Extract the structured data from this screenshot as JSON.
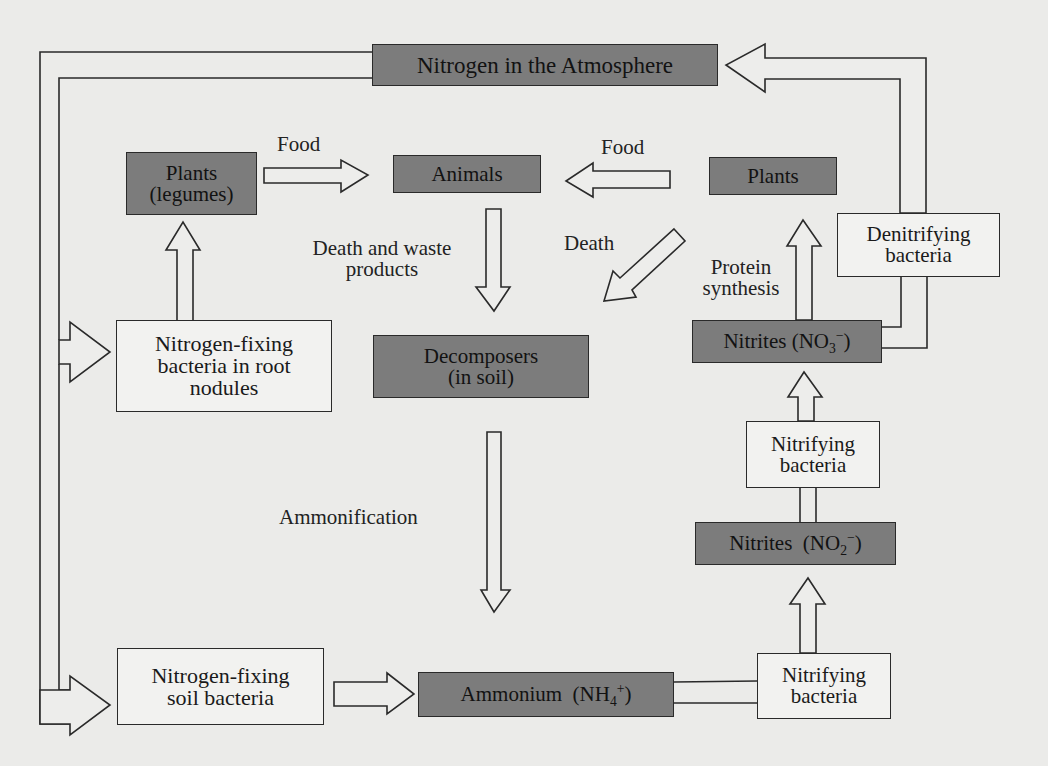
{
  "diagram": {
    "nodes": {
      "atmosphere": {
        "label": "Nitrogen in the Atmosphere",
        "style": "dark"
      },
      "plants_legumes": {
        "line1": "Plants",
        "line2": "(legumes)",
        "style": "dark"
      },
      "animals": {
        "label": "Animals",
        "style": "dark"
      },
      "plants": {
        "label": "Plants",
        "style": "dark"
      },
      "denitrifying": {
        "line1": "Denitrifying",
        "line2": "bacteria",
        "style": "light"
      },
      "root_nodules": {
        "line1": "Nitrogen-fixing",
        "line2": "bacteria in root",
        "line3": "nodules",
        "style": "light"
      },
      "decomposers": {
        "line1": "Decomposers",
        "line2": "(in soil)",
        "style": "dark"
      },
      "nitrates": {
        "prefix": "Nitrites (NO",
        "sub": "3",
        "sup": "−",
        "suffix": ")",
        "style": "dark"
      },
      "nitrifying_upper": {
        "line1": "Nitrifying",
        "line2": "bacteria",
        "style": "light"
      },
      "nitrites": {
        "prefix": "Nitrites  (NO",
        "sub": "2",
        "sup": "−",
        "suffix": ")",
        "style": "dark"
      },
      "soil_bacteria": {
        "line1": "Nitrogen-fixing",
        "line2": "soil bacteria",
        "style": "light"
      },
      "ammonium": {
        "prefix": "Ammonium  (NH",
        "sub": "4",
        "sup": "+",
        "suffix": ")",
        "style": "dark"
      },
      "nitrifying_lower": {
        "line1": "Nitrifying",
        "line2": "bacteria",
        "style": "light"
      }
    },
    "edge_labels": {
      "food_left": "Food",
      "food_right": "Food",
      "death_waste_line1": "Death and waste",
      "death_waste_line2": "products",
      "death": "Death",
      "protein_line1": "Protein",
      "protein_line2": "synthesis",
      "ammonification": "Ammonification"
    },
    "edges": [
      {
        "from": "plants_legumes",
        "to": "animals",
        "label": "Food"
      },
      {
        "from": "plants",
        "to": "animals",
        "label": "Food"
      },
      {
        "from": "animals",
        "to": "decomposers",
        "label": "Death and waste products"
      },
      {
        "from": "plants",
        "to": "decomposers",
        "label": "Death"
      },
      {
        "from": "decomposers",
        "to": "ammonium",
        "label": "Ammonification"
      },
      {
        "from": "atmosphere",
        "to": "root_nodules"
      },
      {
        "from": "atmosphere",
        "to": "soil_bacteria"
      },
      {
        "from": "root_nodules",
        "to": "plants_legumes"
      },
      {
        "from": "soil_bacteria",
        "to": "ammonium"
      },
      {
        "from": "ammonium",
        "to": "nitrifying_lower"
      },
      {
        "from": "nitrifying_lower",
        "to": "nitrites"
      },
      {
        "from": "nitrites",
        "to": "nitrifying_upper"
      },
      {
        "from": "nitrifying_upper",
        "to": "nitrates"
      },
      {
        "from": "nitrates",
        "to": "plants",
        "label": "Protein synthesis"
      },
      {
        "from": "nitrates",
        "to": "denitrifying"
      },
      {
        "from": "denitrifying",
        "to": "atmosphere"
      }
    ]
  }
}
